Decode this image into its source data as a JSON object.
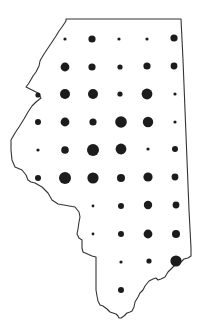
{
  "map": {
    "width": 202,
    "height": 335,
    "background": "#ffffff",
    "outline_color": "#333333",
    "outline_width": 1.1,
    "dot_color": "#1c1c1c",
    "outline_path": "M64,24 L66,21 L66,19 L181,19 L183,60 L185,110 L187,160 L189,210 L191,248 L191,256 L188,258 L184,259 L181,262 L178,264 L175,265 L172,268 L168,272 L165,277 L161,279 L158,280 L156,278 L153,279 L149,281 L145,286 L143,290 L140,293 L138,297 L135,302 L134,307 L132,311 L130,312 L127,313 L124,316 L121,318 L119,318 L118,316 L116,314 L113,313 L110,312 L107,309 L103,306 L100,305 L98,301 L97,296 L96,290 L96,270 L96,257 L92,256 L83,252 L82,248 L82,240 L79,238 L77,234 L78,229 L79,222 L80,217 L79,212 L75,207 L58,204 L52,200 L48,193 L42,187 L35,183 L31,182 L28,180 L26,175 L22,170 L15,167 L12,160 L11,150 L11,140 L15,133 L19,127 L24,119 L28,112 L32,106 L36,102 L41,98 L38,93 L32,90 L26,87 L29,83 L33,76 L36,72 L39,66 L40,61 L41,59 L44,54 L48,48 L52,42 L56,36 L59,31 L62,27 Z",
    "dots": [
      {
        "x": 65,
        "y": 39,
        "r": 1.6
      },
      {
        "x": 92,
        "y": 39,
        "r": 3.6
      },
      {
        "x": 119,
        "y": 39,
        "r": 1.6
      },
      {
        "x": 147,
        "y": 39,
        "r": 1.6
      },
      {
        "x": 174,
        "y": 38,
        "r": 3.6
      },
      {
        "x": 65,
        "y": 67,
        "r": 4.4
      },
      {
        "x": 92,
        "y": 67,
        "r": 3.6
      },
      {
        "x": 120,
        "y": 67,
        "r": 2.6
      },
      {
        "x": 147,
        "y": 66,
        "r": 3.6
      },
      {
        "x": 174,
        "y": 66,
        "r": 3.4
      },
      {
        "x": 38,
        "y": 95,
        "r": 2.6
      },
      {
        "x": 65,
        "y": 94,
        "r": 5.0
      },
      {
        "x": 93,
        "y": 94,
        "r": 5.0
      },
      {
        "x": 120,
        "y": 94,
        "r": 2.6
      },
      {
        "x": 147,
        "y": 94,
        "r": 5.4
      },
      {
        "x": 175,
        "y": 94,
        "r": 1.6
      },
      {
        "x": 38,
        "y": 122,
        "r": 3.0
      },
      {
        "x": 65,
        "y": 122,
        "r": 4.4
      },
      {
        "x": 93,
        "y": 122,
        "r": 3.6
      },
      {
        "x": 121,
        "y": 122,
        "r": 5.8
      },
      {
        "x": 148,
        "y": 122,
        "r": 5.2
      },
      {
        "x": 175,
        "y": 122,
        "r": 1.6
      },
      {
        "x": 38,
        "y": 150,
        "r": 1.6
      },
      {
        "x": 65,
        "y": 150,
        "r": 3.8
      },
      {
        "x": 93,
        "y": 150,
        "r": 6.0
      },
      {
        "x": 121,
        "y": 149,
        "r": 5.4
      },
      {
        "x": 148,
        "y": 149,
        "r": 1.6
      },
      {
        "x": 175,
        "y": 149,
        "r": 3.0
      },
      {
        "x": 38,
        "y": 178,
        "r": 3.0
      },
      {
        "x": 65,
        "y": 178,
        "r": 6.0
      },
      {
        "x": 93,
        "y": 178,
        "r": 5.6
      },
      {
        "x": 121,
        "y": 178,
        "r": 4.0
      },
      {
        "x": 148,
        "y": 177,
        "r": 4.6
      },
      {
        "x": 175,
        "y": 177,
        "r": 3.4
      },
      {
        "x": 93,
        "y": 206,
        "r": 1.4
      },
      {
        "x": 121,
        "y": 206,
        "r": 3.0
      },
      {
        "x": 148,
        "y": 205,
        "r": 4.2
      },
      {
        "x": 176,
        "y": 205,
        "r": 3.4
      },
      {
        "x": 93,
        "y": 234,
        "r": 1.4
      },
      {
        "x": 121,
        "y": 234,
        "r": 3.0
      },
      {
        "x": 148,
        "y": 234,
        "r": 4.4
      },
      {
        "x": 176,
        "y": 234,
        "r": 4.0
      },
      {
        "x": 121,
        "y": 262,
        "r": 1.6
      },
      {
        "x": 149,
        "y": 261,
        "r": 2.6
      },
      {
        "x": 176,
        "y": 261,
        "r": 5.6
      },
      {
        "x": 121,
        "y": 290,
        "r": 3.0
      }
    ]
  }
}
